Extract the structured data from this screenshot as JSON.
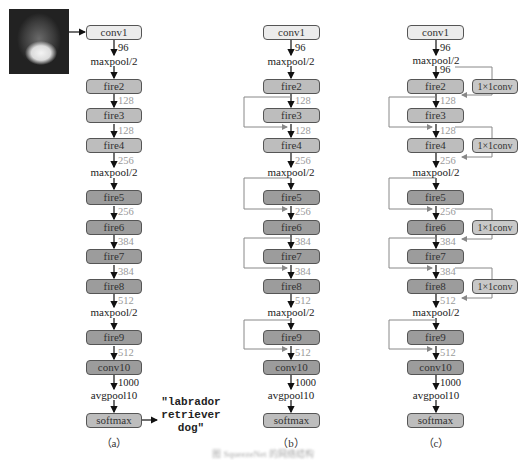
{
  "figure": {
    "caption": "图 SqueezeNet 的网络结构",
    "panels": [
      {
        "id": "a",
        "label": "（a）",
        "input_image": "dog-photo",
        "output_text": [
          "\"labrador",
          "retriever",
          "dog\""
        ],
        "bypass": "none"
      },
      {
        "id": "b",
        "label": "（b）",
        "bypass": "simple"
      },
      {
        "id": "c",
        "label": "（c）",
        "bypass": "complex",
        "bypass_box_label": "1×1conv"
      }
    ],
    "layers": {
      "conv1": "conv1",
      "fire2": "fire2",
      "fire3": "fire3",
      "fire4": "fire4",
      "fire5": "fire5",
      "fire6": "fire6",
      "fire7": "fire7",
      "fire8": "fire8",
      "fire9": "fire9",
      "conv10": "conv10",
      "softmax": "softmax"
    },
    "edges": {
      "conv1_out": "96",
      "maxpool1": "maxpool/2",
      "c_after_pool1": "96",
      "fire2_out": "128",
      "fire3_out": "128",
      "fire4_out": "256",
      "maxpool2": "maxpool/2",
      "fire5_out": "256",
      "fire6_out": "384",
      "fire7_out": "384",
      "fire8_out": "512",
      "maxpool3": "maxpool/2",
      "fire9_out": "512",
      "conv10_out": "1000",
      "avgpool": "avgpool10"
    },
    "colors": {
      "light_box": "#ececec",
      "mid_box": "#bdbdbd",
      "dark_box": "#9c9c9c",
      "gray_label": "#9a9a9a",
      "bypass_line": "#8c8c8c"
    }
  }
}
